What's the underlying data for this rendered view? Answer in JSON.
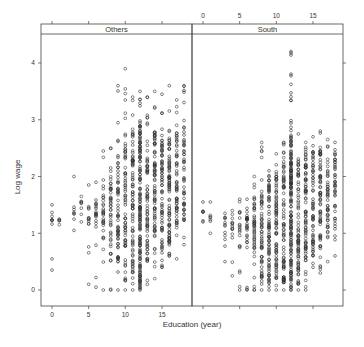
{
  "chart_data": {
    "type": "scatter",
    "title": "",
    "xlabel": "Education (year)",
    "ylabel": "Log wage",
    "xlim": [
      -1.5,
      19
    ],
    "ylim": [
      -0.3,
      4.3
    ],
    "x_ticks": [
      0,
      5,
      10,
      15
    ],
    "y_ticks": [
      0,
      1,
      2,
      3,
      4
    ],
    "grid": false,
    "layout": "lattice 1x2 panels with strip headers",
    "panels": [
      {
        "name": "Others",
        "columns": [
          {
            "x": 0,
            "min": 0.35,
            "max": 1.5,
            "dense": [
              1.1,
              1.3
            ],
            "n": 8
          },
          {
            "x": 1,
            "min": 1.15,
            "max": 1.25,
            "dense": [
              1.15,
              1.25
            ],
            "n": 3
          },
          {
            "x": 3,
            "min": 1.05,
            "max": 2.0,
            "dense": [
              1.3,
              1.5
            ],
            "n": 6
          },
          {
            "x": 4,
            "min": 1.2,
            "max": 1.65,
            "dense": [
              1.3,
              1.6
            ],
            "n": 6
          },
          {
            "x": 5,
            "min": 0.1,
            "max": 1.85,
            "dense": [
              1.1,
              1.5
            ],
            "n": 12
          },
          {
            "x": 6,
            "min": 0.05,
            "max": 1.9,
            "dense": [
              1.05,
              1.6
            ],
            "n": 18
          },
          {
            "x": 7,
            "min": 0.0,
            "max": 2.45,
            "dense": [
              0.9,
              2.0
            ],
            "n": 30
          },
          {
            "x": 8,
            "min": 0.0,
            "max": 2.5,
            "dense": [
              0.5,
              2.1
            ],
            "n": 45
          },
          {
            "x": 9,
            "min": 0.0,
            "max": 3.6,
            "dense": [
              0.3,
              2.4
            ],
            "n": 60
          },
          {
            "x": 10,
            "min": 0.0,
            "max": 3.9,
            "dense": [
              0.1,
              2.6
            ],
            "n": 70
          },
          {
            "x": 11,
            "min": 0.0,
            "max": 3.4,
            "dense": [
              0.2,
              2.8
            ],
            "n": 80
          },
          {
            "x": 12,
            "min": 0.0,
            "max": 3.5,
            "dense": [
              0.0,
              3.0
            ],
            "n": 150
          },
          {
            "x": 13,
            "min": 0.1,
            "max": 3.4,
            "dense": [
              0.5,
              2.5
            ],
            "n": 70
          },
          {
            "x": 14,
            "min": 0.2,
            "max": 3.5,
            "dense": [
              0.7,
              2.8
            ],
            "n": 80
          },
          {
            "x": 15,
            "min": 0.4,
            "max": 3.45,
            "dense": [
              0.6,
              2.7
            ],
            "n": 70
          },
          {
            "x": 16,
            "min": 0.6,
            "max": 3.6,
            "dense": [
              0.8,
              2.8
            ],
            "n": 85
          },
          {
            "x": 17,
            "min": 0.55,
            "max": 3.35,
            "dense": [
              1.1,
              2.8
            ],
            "n": 60
          },
          {
            "x": 18,
            "min": 0.8,
            "max": 3.6,
            "dense": [
              1.2,
              3.0
            ],
            "n": 50
          }
        ]
      },
      {
        "name": "South",
        "columns": [
          {
            "x": 0,
            "min": 1.2,
            "max": 1.55,
            "dense": [
              1.3,
              1.4
            ],
            "n": 5
          },
          {
            "x": 1,
            "min": 1.0,
            "max": 1.55,
            "dense": [
              1.2,
              1.35
            ],
            "n": 5
          },
          {
            "x": 3,
            "min": 0.5,
            "max": 1.35,
            "dense": [
              0.9,
              1.3
            ],
            "n": 10
          },
          {
            "x": 4,
            "min": 0.25,
            "max": 1.4,
            "dense": [
              0.9,
              1.35
            ],
            "n": 12
          },
          {
            "x": 5,
            "min": 0.0,
            "max": 1.6,
            "dense": [
              0.7,
              1.4
            ],
            "n": 18
          },
          {
            "x": 6,
            "min": 0.0,
            "max": 1.6,
            "dense": [
              0.8,
              1.5
            ],
            "n": 25
          },
          {
            "x": 7,
            "min": 0.0,
            "max": 2.0,
            "dense": [
              0.5,
              1.7
            ],
            "n": 45
          },
          {
            "x": 8,
            "min": 0.0,
            "max": 2.6,
            "dense": [
              0.1,
              1.8
            ],
            "n": 60
          },
          {
            "x": 9,
            "min": 0.0,
            "max": 2.1,
            "dense": [
              0.1,
              2.0
            ],
            "n": 70
          },
          {
            "x": 10,
            "min": 0.0,
            "max": 2.4,
            "dense": [
              0.2,
              2.1
            ],
            "n": 75
          },
          {
            "x": 11,
            "min": 0.0,
            "max": 2.6,
            "dense": [
              0.1,
              2.3
            ],
            "n": 80
          },
          {
            "x": 12,
            "min": 0.0,
            "max": 4.2,
            "dense": [
              0.0,
              2.7
            ],
            "n": 160
          },
          {
            "x": 13,
            "min": 0.0,
            "max": 2.75,
            "dense": [
              0.1,
              2.3
            ],
            "n": 75
          },
          {
            "x": 14,
            "min": 0.0,
            "max": 2.6,
            "dense": [
              0.5,
              2.4
            ],
            "n": 80
          },
          {
            "x": 15,
            "min": 0.4,
            "max": 2.7,
            "dense": [
              0.6,
              2.5
            ],
            "n": 60
          },
          {
            "x": 16,
            "min": 0.3,
            "max": 2.8,
            "dense": [
              0.7,
              2.5
            ],
            "n": 70
          },
          {
            "x": 17,
            "min": 0.5,
            "max": 2.65,
            "dense": [
              1.0,
              2.4
            ],
            "n": 45
          },
          {
            "x": 18,
            "min": 0.6,
            "max": 2.6,
            "dense": [
              1.1,
              2.5
            ],
            "n": 40
          }
        ]
      }
    ]
  },
  "colors": {
    "point": "#333333",
    "axis": "#444444",
    "strip_bg": "#ffffff",
    "background": "#ffffff"
  }
}
